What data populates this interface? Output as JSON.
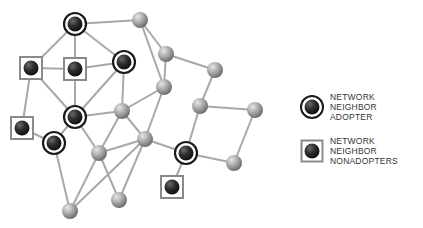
{
  "header_cut_text": "(figure text cut off at top)",
  "legend": [
    {
      "type": "adopter",
      "lines": [
        "NETWORK",
        "NEIGHBOR",
        "ADOPTER"
      ]
    },
    {
      "type": "nonadopter",
      "lines": [
        "NETWORK",
        "NEIGHBOR",
        "NONADOPTERS"
      ]
    }
  ],
  "colors": {
    "edge": "#a8a8a8",
    "gray_node": "#a0a0a0",
    "dark_node": "#2a2a2a",
    "ring": "#1a1a1a",
    "square": "#8a8a8a"
  },
  "nodes": [
    {
      "id": "A",
      "x": 75,
      "y": 24,
      "type": "adopter"
    },
    {
      "id": "B",
      "x": 140,
      "y": 20,
      "type": "gray"
    },
    {
      "id": "C",
      "x": 124,
      "y": 62,
      "type": "adopter"
    },
    {
      "id": "D",
      "x": 31,
      "y": 68,
      "type": "nonadopter"
    },
    {
      "id": "E",
      "x": 75,
      "y": 69,
      "type": "nonadopter"
    },
    {
      "id": "F",
      "x": 166,
      "y": 54,
      "type": "gray"
    },
    {
      "id": "F2",
      "x": 215,
      "y": 70,
      "type": "gray"
    },
    {
      "id": "K",
      "x": 164,
      "y": 87,
      "type": "gray"
    },
    {
      "id": "G",
      "x": 75,
      "y": 117,
      "type": "adopter"
    },
    {
      "id": "H",
      "x": 122,
      "y": 111,
      "type": "gray"
    },
    {
      "id": "I",
      "x": 22,
      "y": 128,
      "type": "nonadopter"
    },
    {
      "id": "J",
      "x": 54,
      "y": 143,
      "type": "adopter"
    },
    {
      "id": "L",
      "x": 145,
      "y": 139,
      "type": "gray"
    },
    {
      "id": "M",
      "x": 99,
      "y": 153,
      "type": "gray"
    },
    {
      "id": "N",
      "x": 200,
      "y": 106,
      "type": "gray"
    },
    {
      "id": "O",
      "x": 255,
      "y": 110,
      "type": "gray"
    },
    {
      "id": "P",
      "x": 186,
      "y": 153,
      "type": "adopter"
    },
    {
      "id": "Q",
      "x": 234,
      "y": 163,
      "type": "gray"
    },
    {
      "id": "R",
      "x": 172,
      "y": 187,
      "type": "nonadopter"
    },
    {
      "id": "S",
      "x": 119,
      "y": 200,
      "type": "gray"
    },
    {
      "id": "T",
      "x": 70,
      "y": 211,
      "type": "gray"
    }
  ],
  "edges": [
    [
      "A",
      "B"
    ],
    [
      "A",
      "E"
    ],
    [
      "A",
      "C"
    ],
    [
      "A",
      "D"
    ],
    [
      "B",
      "F"
    ],
    [
      "B",
      "K"
    ],
    [
      "C",
      "E"
    ],
    [
      "C",
      "G"
    ],
    [
      "C",
      "H"
    ],
    [
      "D",
      "E"
    ],
    [
      "D",
      "G"
    ],
    [
      "D",
      "I"
    ],
    [
      "E",
      "G"
    ],
    [
      "F",
      "F2"
    ],
    [
      "F",
      "K"
    ],
    [
      "F2",
      "N"
    ],
    [
      "K",
      "L"
    ],
    [
      "K",
      "H"
    ],
    [
      "G",
      "J"
    ],
    [
      "G",
      "H"
    ],
    [
      "G",
      "M"
    ],
    [
      "H",
      "L"
    ],
    [
      "H",
      "M"
    ],
    [
      "I",
      "J"
    ],
    [
      "J",
      "T"
    ],
    [
      "M",
      "T"
    ],
    [
      "M",
      "S"
    ],
    [
      "L",
      "M"
    ],
    [
      "L",
      "T"
    ],
    [
      "L",
      "S"
    ],
    [
      "L",
      "P"
    ],
    [
      "N",
      "P"
    ],
    [
      "N",
      "O"
    ],
    [
      "O",
      "Q"
    ],
    [
      "P",
      "Q"
    ],
    [
      "P",
      "R"
    ]
  ]
}
